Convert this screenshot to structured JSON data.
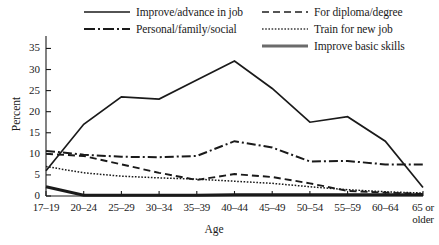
{
  "chart_data": {
    "type": "line",
    "title": "",
    "xlabel": "Age",
    "ylabel": "Percent",
    "categories": [
      "17–19",
      "20–24",
      "25–29",
      "30–34",
      "35–39",
      "40–44",
      "45–49",
      "50–54",
      "55–59",
      "60–64",
      "65 or older"
    ],
    "ylim": [
      0,
      37
    ],
    "yticks": [
      0,
      5,
      10,
      15,
      20,
      25,
      30,
      35
    ],
    "ytick_labels": [
      "0",
      "5",
      "10",
      "15",
      "20",
      "25",
      "30",
      "35"
    ],
    "grid": false,
    "legend_position": "top",
    "series": [
      {
        "name": "Improve/advance in job",
        "style": "solid",
        "color": "#1a1a1a",
        "values": [
          6.0,
          17.0,
          23.5,
          23.0,
          27.5,
          32.0,
          25.5,
          17.5,
          18.8,
          13.0,
          2.0
        ]
      },
      {
        "name": "For diploma/degree",
        "style": "dashed",
        "color": "#555555",
        "values": [
          10.0,
          9.5,
          7.5,
          5.5,
          3.8,
          5.2,
          4.5,
          3.0,
          1.2,
          0.8,
          0.5
        ]
      },
      {
        "name": "Personal/family/social",
        "style": "dashdot",
        "color": "#1a1a1a",
        "values": [
          10.7,
          9.8,
          9.3,
          9.2,
          9.5,
          13.0,
          11.5,
          8.2,
          8.3,
          7.5,
          7.5
        ]
      },
      {
        "name": "Train for new job",
        "style": "dotted",
        "color": "#3a3a3a",
        "values": [
          7.0,
          5.5,
          4.7,
          4.3,
          4.0,
          3.5,
          3.0,
          2.2,
          1.5,
          1.0,
          0.7
        ]
      },
      {
        "name": "Improve basic skills",
        "style": "thick-solid",
        "color": "#6b6b6b",
        "values": [
          2.2,
          0.2,
          0.2,
          0.2,
          0.2,
          0.3,
          0.3,
          0.3,
          0.3,
          0.3,
          0.3
        ]
      }
    ]
  },
  "legend": {
    "items": [
      {
        "label": "Improve/advance in job"
      },
      {
        "label": "Personal/family/social"
      },
      {
        "label": "For diploma/degree"
      },
      {
        "label": "Train for new job"
      },
      {
        "label": "Improve basic skills"
      }
    ]
  }
}
